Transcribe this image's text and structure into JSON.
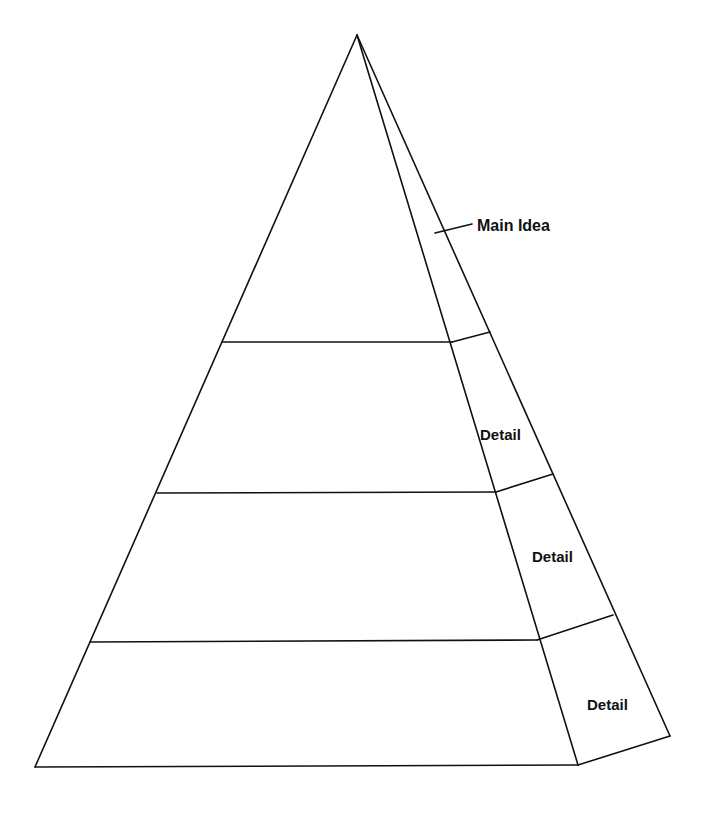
{
  "diagram": {
    "type": "pyramid",
    "levels": [
      {
        "id": "top",
        "label": "Main Idea"
      },
      {
        "id": "level2",
        "label": "Detail"
      },
      {
        "id": "level3",
        "label": "Detail"
      },
      {
        "id": "bottom",
        "label": "Detail"
      }
    ],
    "colors": {
      "stroke": "#111111",
      "background": "#ffffff"
    }
  }
}
